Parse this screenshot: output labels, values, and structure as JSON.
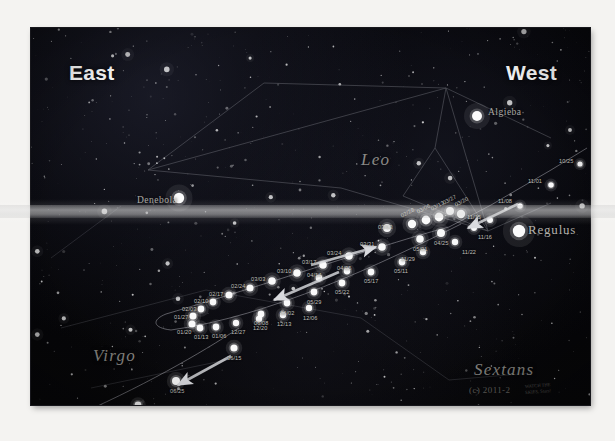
{
  "figure": {
    "kind": "star-chart",
    "background_color": "#050508"
  },
  "cardinals": [
    {
      "name": "east",
      "label": "East",
      "x": 38,
      "y": 33
    },
    {
      "name": "west",
      "label": "West",
      "x": 475,
      "y": 33
    }
  ],
  "constellations": [
    {
      "name": "leo",
      "label": "Leo",
      "x": 330,
      "y": 122
    },
    {
      "name": "virgo",
      "label": "Virgo",
      "x": 62,
      "y": 318
    },
    {
      "name": "sextans",
      "label": "Sextans",
      "x": 443,
      "y": 332
    }
  ],
  "named_stars": [
    {
      "name": "denebola",
      "label": "Denebola",
      "x": 106,
      "y": 167,
      "dot_x": 148,
      "dot_y": 170,
      "size": 5.2,
      "align": "right"
    },
    {
      "name": "algieba",
      "label": "Algieba",
      "x": 457,
      "y": 79,
      "dot_x": 446,
      "dot_y": 88,
      "size": 5.0,
      "align": "right"
    },
    {
      "name": "regulus",
      "label": "Regulus",
      "x": 497,
      "y": 194,
      "dot_x": 488,
      "dot_y": 203,
      "size": 6.2,
      "align": "left",
      "big": true
    }
  ],
  "credit": {
    "text": "(c) 2011-2",
    "sub_line1": "WATCH THE",
    "sub_line2": "SKIES, Stars!"
  },
  "track_dates": {
    "inbound": [
      "10/25",
      "11/01",
      "11/08",
      "11/15",
      "11/22",
      "11/29"
    ],
    "retrograde": [
      "12/06",
      "12/13",
      "12/20",
      "12/27",
      "01/03",
      "01/13",
      "01/20",
      "01/27",
      "02/03",
      "02/10",
      "02/17",
      "02/24",
      "03/03",
      "03/10",
      "03/17",
      "03/24",
      "03/31"
    ],
    "outbound": [
      "04/05",
      "04/14",
      "04/21",
      "04/28",
      "05/05",
      "05/11",
      "05/17",
      "05/22",
      "05/29",
      "06/02",
      "06/08",
      "06/15",
      "06/25",
      "07/01",
      "07/06"
    ]
  },
  "date_markers": [
    {
      "label": "10/25",
      "x": 549,
      "y": 136,
      "lx": 528,
      "ly": 130,
      "r": 2.6,
      "rot": 0
    },
    {
      "label": "11/01",
      "x": 520,
      "y": 157,
      "lx": 497,
      "ly": 150,
      "r": 2.8,
      "rot": 0
    },
    {
      "label": "11/08",
      "x": 489,
      "y": 178,
      "lx": 467,
      "ly": 170,
      "r": 2.8,
      "rot": 0
    },
    {
      "label": "11/15",
      "x": 459,
      "y": 192,
      "lx": 436,
      "ly": 186,
      "r": 3.0,
      "rot": 0
    },
    {
      "label": "11/16",
      "x": 443,
      "y": 200,
      "lx": 447,
      "ly": 206,
      "r": 3.0,
      "rot": 0
    },
    {
      "label": "11/22",
      "x": 424,
      "y": 214,
      "lx": 431,
      "ly": 221,
      "r": 3.2,
      "rot": 0
    },
    {
      "label": "11/29",
      "x": 392,
      "y": 224,
      "lx": 370,
      "ly": 228,
      "r": 3.2,
      "rot": 0
    },
    {
      "label": "03/20",
      "x": 430,
      "y": 186,
      "lx": 424,
      "ly": 174,
      "r": 4.2,
      "rot": -28
    },
    {
      "label": "03/27",
      "x": 419,
      "y": 183,
      "lx": 412,
      "ly": 172,
      "r": 4.0,
      "rot": -28
    },
    {
      "label": "03/13",
      "x": 408,
      "y": 189,
      "lx": 400,
      "ly": 178,
      "r": 4.4,
      "rot": -28
    },
    {
      "label": "03/06",
      "x": 395,
      "y": 192,
      "lx": 386,
      "ly": 181,
      "r": 4.4,
      "rot": -28
    },
    {
      "label": "02/28",
      "x": 381,
      "y": 196,
      "lx": 370,
      "ly": 185,
      "r": 4.2,
      "rot": -28
    },
    {
      "label": "03/13",
      "x": 356,
      "y": 200,
      "lx": 347,
      "ly": 196,
      "r": 4.0,
      "rot": 0
    },
    {
      "label": "04/25",
      "x": 410,
      "y": 205,
      "lx": 403,
      "ly": 212,
      "r": 4.0,
      "rot": 0
    },
    {
      "label": "05/01",
      "x": 389,
      "y": 211,
      "lx": 382,
      "ly": 218,
      "r": 3.8,
      "rot": 0
    },
    {
      "label": "03/31",
      "x": 351,
      "y": 219,
      "lx": 329,
      "ly": 213,
      "r": 3.8,
      "rot": 0
    },
    {
      "label": "03/24",
      "x": 318,
      "y": 228,
      "lx": 296,
      "ly": 222,
      "r": 3.8,
      "rot": 0
    },
    {
      "label": "03/17",
      "x": 292,
      "y": 237,
      "lx": 271,
      "ly": 231,
      "r": 3.8,
      "rot": 0
    },
    {
      "label": "03/10",
      "x": 266,
      "y": 245,
      "lx": 246,
      "ly": 240,
      "r": 3.8,
      "rot": 0
    },
    {
      "label": "03/03",
      "x": 241,
      "y": 253,
      "lx": 220,
      "ly": 248,
      "r": 3.8,
      "rot": 0
    },
    {
      "label": "02/24",
      "x": 219,
      "y": 260,
      "lx": 200,
      "ly": 255,
      "r": 3.6,
      "rot": 0
    },
    {
      "label": "02/17",
      "x": 198,
      "y": 267,
      "lx": 178,
      "ly": 263,
      "r": 3.6,
      "rot": 0
    },
    {
      "label": "02/10",
      "x": 182,
      "y": 274,
      "lx": 163,
      "ly": 270,
      "r": 3.4,
      "rot": 0
    },
    {
      "label": "02/03",
      "x": 170,
      "y": 281,
      "lx": 151,
      "ly": 278,
      "r": 3.4,
      "rot": 0
    },
    {
      "label": "01/27",
      "x": 162,
      "y": 288,
      "lx": 143,
      "ly": 286,
      "r": 3.6,
      "rot": 0
    },
    {
      "label": "01/20",
      "x": 161,
      "y": 296,
      "lx": 146,
      "ly": 301,
      "r": 3.6,
      "rot": 0
    },
    {
      "label": "01/13",
      "x": 169,
      "y": 300,
      "lx": 163,
      "ly": 306,
      "r": 3.4,
      "rot": 0
    },
    {
      "label": "01/06",
      "x": 185,
      "y": 299,
      "lx": 181,
      "ly": 305,
      "r": 3.4,
      "rot": 0
    },
    {
      "label": "12/27",
      "x": 205,
      "y": 295,
      "lx": 200,
      "ly": 301,
      "r": 3.2,
      "rot": 0
    },
    {
      "label": "12/20",
      "x": 228,
      "y": 291,
      "lx": 222,
      "ly": 297,
      "r": 3.2,
      "rot": 0
    },
    {
      "label": "12/13",
      "x": 252,
      "y": 287,
      "lx": 246,
      "ly": 293,
      "r": 3.2,
      "rot": 0
    },
    {
      "label": "12/06",
      "x": 278,
      "y": 280,
      "lx": 272,
      "ly": 287,
      "r": 3.2,
      "rot": 0
    },
    {
      "label": "04/14",
      "x": 288,
      "y": 250,
      "lx": 276,
      "ly": 244,
      "r": 3.4,
      "rot": 0
    },
    {
      "label": "04/05",
      "x": 316,
      "y": 243,
      "lx": 306,
      "ly": 237,
      "r": 3.4,
      "rot": 0
    },
    {
      "label": "05/11",
      "x": 371,
      "y": 234,
      "lx": 363,
      "ly": 240,
      "r": 3.4,
      "rot": 0
    },
    {
      "label": "05/17",
      "x": 340,
      "y": 244,
      "lx": 333,
      "ly": 250,
      "r": 3.4,
      "rot": 0
    },
    {
      "label": "05/22",
      "x": 311,
      "y": 255,
      "lx": 304,
      "ly": 261,
      "r": 3.4,
      "rot": 0
    },
    {
      "label": "05/29",
      "x": 283,
      "y": 264,
      "lx": 276,
      "ly": 271,
      "r": 3.4,
      "rot": 0
    },
    {
      "label": "06/02",
      "x": 256,
      "y": 275,
      "lx": 249,
      "ly": 282,
      "r": 3.4,
      "rot": 0
    },
    {
      "label": "06/08",
      "x": 230,
      "y": 286,
      "lx": 223,
      "ly": 292,
      "r": 3.4,
      "rot": 0
    },
    {
      "label": "06/15",
      "x": 203,
      "y": 320,
      "lx": 196,
      "ly": 327,
      "r": 3.6,
      "rot": 0
    },
    {
      "label": "06/25",
      "x": 145,
      "y": 353,
      "lx": 139,
      "ly": 360,
      "r": 4.0,
      "rot": 0
    },
    {
      "label": "07/01",
      "x": 107,
      "y": 377,
      "lx": 101,
      "ly": 384,
      "r": 3.4,
      "rot": 0
    },
    {
      "label": "07/06",
      "x": 69,
      "y": 391,
      "lx": 63,
      "ly": 398,
      "r": 3.0,
      "rot": 0
    }
  ],
  "arrows": [
    {
      "name": "arrow-inbound",
      "x1": 487,
      "y1": 176,
      "x2": 437,
      "y2": 200
    },
    {
      "name": "arrow-retrograde",
      "x1": 308,
      "y1": 244,
      "x2": 243,
      "y2": 272
    },
    {
      "name": "arrow-outbound-upper",
      "x1": 280,
      "y1": 237,
      "x2": 345,
      "y2": 219
    },
    {
      "name": "arrow-outbound-lower",
      "x1": 200,
      "y1": 328,
      "x2": 147,
      "y2": 357
    }
  ]
}
